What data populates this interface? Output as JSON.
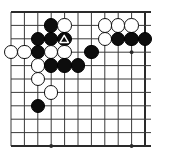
{
  "diagram": {
    "kind": "go-board-problem-diagram",
    "board": {
      "columns": 11,
      "rows": 11,
      "origin_x": 11,
      "origin_y": 12,
      "spacing": 13.4,
      "edges": {
        "top": true,
        "right": true,
        "bottom": true,
        "left": false
      },
      "line_color": "#3a3a3a",
      "edge_line_color": "#2a2a2a",
      "background_color": "#ffffff"
    },
    "star_points": [
      {
        "col": 3,
        "row": 3
      },
      {
        "col": 9,
        "row": 3
      },
      {
        "col": 3,
        "row": 10
      },
      {
        "col": 9,
        "row": 10
      }
    ],
    "stone_colors": {
      "black": "#0d0d0d",
      "white": "#ffffff",
      "outline": "#111111"
    },
    "stone_radius": 7.2,
    "stones": [
      {
        "col": 3,
        "row": 1,
        "color": "black",
        "mark": null
      },
      {
        "col": 4,
        "row": 1,
        "color": "white",
        "mark": null
      },
      {
        "col": 7,
        "row": 1,
        "color": "white",
        "mark": null
      },
      {
        "col": 8,
        "row": 1,
        "color": "white",
        "mark": null
      },
      {
        "col": 9,
        "row": 1,
        "color": "white",
        "mark": null
      },
      {
        "col": 2,
        "row": 2,
        "color": "black",
        "mark": null
      },
      {
        "col": 3,
        "row": 2,
        "color": "black",
        "mark": null
      },
      {
        "col": 4,
        "row": 2,
        "color": "black",
        "mark": "triangle"
      },
      {
        "col": 7,
        "row": 2,
        "color": "white",
        "mark": null
      },
      {
        "col": 8,
        "row": 2,
        "color": "black",
        "mark": null
      },
      {
        "col": 9,
        "row": 2,
        "color": "black",
        "mark": null
      },
      {
        "col": 10,
        "row": 2,
        "color": "black",
        "mark": null
      },
      {
        "col": 0,
        "row": 3,
        "color": "white",
        "mark": null
      },
      {
        "col": 1,
        "row": 3,
        "color": "white",
        "mark": null
      },
      {
        "col": 2,
        "row": 3,
        "color": "black",
        "mark": null
      },
      {
        "col": 3,
        "row": 3,
        "color": "white",
        "mark": null
      },
      {
        "col": 4,
        "row": 3,
        "color": "white",
        "mark": null
      },
      {
        "col": 6,
        "row": 3,
        "color": "black",
        "mark": null
      },
      {
        "col": 2,
        "row": 4,
        "color": "white",
        "mark": null
      },
      {
        "col": 3,
        "row": 4,
        "color": "black",
        "mark": null
      },
      {
        "col": 4,
        "row": 4,
        "color": "black",
        "mark": null
      },
      {
        "col": 5,
        "row": 4,
        "color": "black",
        "mark": null
      },
      {
        "col": 2,
        "row": 5,
        "color": "white",
        "mark": null
      },
      {
        "col": 3,
        "row": 6,
        "color": "white",
        "mark": null
      },
      {
        "col": 2,
        "row": 7,
        "color": "black",
        "mark": null
      }
    ]
  }
}
